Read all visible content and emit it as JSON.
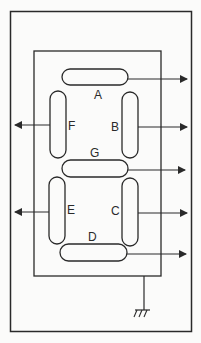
{
  "diagram": {
    "colors": {
      "line": "#2a2a2a",
      "background": "#fbfbfa"
    },
    "segments": [
      {
        "id": "A",
        "label": "A",
        "orientation": "horizontal",
        "output_direction": "right"
      },
      {
        "id": "B",
        "label": "B",
        "orientation": "vertical",
        "output_direction": "right"
      },
      {
        "id": "C",
        "label": "C",
        "orientation": "vertical",
        "output_direction": "right"
      },
      {
        "id": "D",
        "label": "D",
        "orientation": "horizontal",
        "output_direction": "right"
      },
      {
        "id": "E",
        "label": "E",
        "orientation": "vertical",
        "output_direction": "left"
      },
      {
        "id": "F",
        "label": "F",
        "orientation": "vertical",
        "output_direction": "left"
      },
      {
        "id": "G",
        "label": "G",
        "orientation": "horizontal",
        "output_direction": "right"
      }
    ],
    "ground": {
      "icon": "ground-icon"
    }
  }
}
